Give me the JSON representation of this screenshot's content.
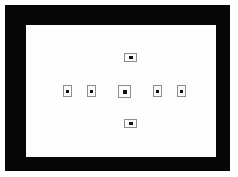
{
  "screen": {
    "width": 238,
    "height": 177,
    "background_color": "#ffffff",
    "label": "Viewfinder"
  },
  "viewfinder": {
    "frame_color": "#060606",
    "screen_color": "#fdfdfd",
    "frame_label": "Viewfinder mask",
    "screen_label": "Focusing screen"
  },
  "af_points": {
    "marker_border_color": "#8d8d8d",
    "marker_fill_color": "#fbfbfb",
    "dot_color": "#111111",
    "count": 7,
    "items": [
      {
        "id": "af-top",
        "label": "Top AF point",
        "shape": "wide",
        "selected": false,
        "x": 98,
        "y": 28
      },
      {
        "id": "af-far-left",
        "label": "Far left AF point",
        "shape": "side",
        "selected": false,
        "x": 37,
        "y": 60
      },
      {
        "id": "af-left",
        "label": "Left AF point",
        "shape": "side",
        "selected": false,
        "x": 61,
        "y": 60
      },
      {
        "id": "af-center",
        "label": "Center AF point",
        "shape": "center",
        "selected": true,
        "x": 92,
        "y": 60
      },
      {
        "id": "af-right",
        "label": "Right AF point",
        "shape": "side",
        "selected": false,
        "x": 127,
        "y": 60
      },
      {
        "id": "af-far-right",
        "label": "Far right AF point",
        "shape": "side",
        "selected": false,
        "x": 151,
        "y": 60
      },
      {
        "id": "af-bottom",
        "label": "Bottom AF point",
        "shape": "wide",
        "selected": false,
        "x": 98,
        "y": 94
      }
    ]
  }
}
